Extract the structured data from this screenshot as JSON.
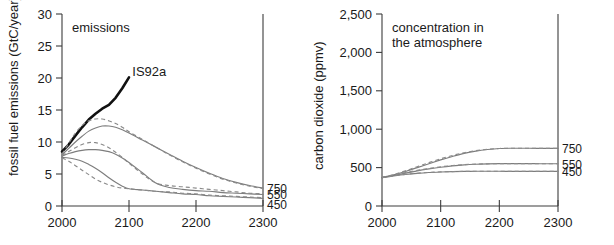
{
  "figure": {
    "panel_count": 2
  },
  "chart_data": [
    {
      "type": "line",
      "panel_id": "emissions",
      "title": "emissions",
      "xlabel": "",
      "ylabel": "fossil fuel emissions (GtC/year)",
      "xlim": [
        2000,
        2300
      ],
      "ylim": [
        0,
        30
      ],
      "xticks": [
        2000,
        2100,
        2200,
        2300
      ],
      "xtick_labels": [
        "2000",
        "2100",
        "2200",
        "2300"
      ],
      "yticks": [
        0,
        5,
        10,
        15,
        20,
        25,
        30
      ],
      "ytick_labels": [
        "0",
        "5",
        "10",
        "15",
        "20",
        "25",
        "30"
      ],
      "grid": false,
      "legend_position": "right-edge-inline",
      "right_edge_labels": [
        "750",
        "550",
        "450"
      ],
      "annotations": [
        {
          "text": "IS92a",
          "x": 2105,
          "y": 20.0
        }
      ],
      "series": [
        {
          "name": "IS92a",
          "style": "solid-bold",
          "x": [
            2000,
            2010,
            2020,
            2030,
            2040,
            2050,
            2060,
            2070,
            2080,
            2090,
            2100
          ],
          "values": [
            8.5,
            9.6,
            11.0,
            12.3,
            13.5,
            14.4,
            15.2,
            15.8,
            16.9,
            18.4,
            20.1
          ]
        },
        {
          "name": "750 (WRE750 solid)",
          "style": "solid",
          "x": [
            2000,
            2010,
            2020,
            2030,
            2040,
            2050,
            2060,
            2070,
            2080,
            2090,
            2100,
            2120,
            2140,
            2160,
            2180,
            2200,
            2220,
            2240,
            2260,
            2280,
            2300
          ],
          "values": [
            8.0,
            9.0,
            10.0,
            10.9,
            11.7,
            12.2,
            12.5,
            12.5,
            12.3,
            11.9,
            11.4,
            10.3,
            9.2,
            8.1,
            7.0,
            6.0,
            5.1,
            4.3,
            3.7,
            3.2,
            2.8
          ]
        },
        {
          "name": "750 (S750 dashed)",
          "style": "dashed",
          "x": [
            2000,
            2010,
            2020,
            2030,
            2040,
            2050,
            2060,
            2070,
            2080,
            2090,
            2100,
            2120,
            2140,
            2160,
            2180,
            2200,
            2220,
            2240,
            2260,
            2280,
            2300
          ],
          "values": [
            8.1,
            9.8,
            11.4,
            12.6,
            13.3,
            13.6,
            13.6,
            13.3,
            12.9,
            12.3,
            11.6,
            10.4,
            9.2,
            8.0,
            6.9,
            5.9,
            5.0,
            4.2,
            3.6,
            3.1,
            2.7
          ]
        },
        {
          "name": "550 (WRE550 solid)",
          "style": "solid",
          "x": [
            2000,
            2010,
            2020,
            2030,
            2040,
            2050,
            2060,
            2070,
            2080,
            2090,
            2100,
            2120,
            2140,
            2160,
            2180,
            2200,
            2220,
            2240,
            2260,
            2280,
            2300
          ],
          "values": [
            7.8,
            8.2,
            8.5,
            8.7,
            8.8,
            8.8,
            8.7,
            8.5,
            8.1,
            7.5,
            6.8,
            5.2,
            3.6,
            2.9,
            2.6,
            2.4,
            2.3,
            2.1,
            2.0,
            1.9,
            1.8
          ]
        },
        {
          "name": "550 (S550 dashed)",
          "style": "dashed",
          "x": [
            2000,
            2010,
            2020,
            2030,
            2040,
            2050,
            2060,
            2070,
            2080,
            2090,
            2100,
            2120,
            2140,
            2160,
            2180,
            2200,
            2220,
            2240,
            2260,
            2280,
            2300
          ],
          "values": [
            7.9,
            8.5,
            9.1,
            9.6,
            9.9,
            9.9,
            9.6,
            9.1,
            8.4,
            7.6,
            6.7,
            5.0,
            3.6,
            3.2,
            3.0,
            2.8,
            2.6,
            2.4,
            2.2,
            2.0,
            1.9
          ]
        },
        {
          "name": "450 (WRE450 solid)",
          "style": "solid",
          "x": [
            2000,
            2010,
            2020,
            2030,
            2040,
            2050,
            2060,
            2070,
            2080,
            2090,
            2100,
            2120,
            2140,
            2160,
            2180,
            2200,
            2220,
            2240,
            2260,
            2280,
            2300
          ],
          "values": [
            7.6,
            7.5,
            7.3,
            7.0,
            6.5,
            5.9,
            5.2,
            4.4,
            3.7,
            3.1,
            2.7,
            2.5,
            2.3,
            2.1,
            1.9,
            1.8,
            1.6,
            1.5,
            1.4,
            1.3,
            1.2
          ]
        },
        {
          "name": "450 (S450 dashed)",
          "style": "dashed",
          "x": [
            2000,
            2010,
            2020,
            2030,
            2040,
            2050,
            2060,
            2070,
            2080,
            2090,
            2100,
            2120,
            2140,
            2160,
            2180,
            2200,
            2220,
            2240,
            2260,
            2280,
            2300
          ],
          "values": [
            7.5,
            7.0,
            6.3,
            5.6,
            4.9,
            4.2,
            3.7,
            3.3,
            3.0,
            2.8,
            2.7,
            2.5,
            2.3,
            2.2,
            2.0,
            1.9,
            1.7,
            1.6,
            1.5,
            1.4,
            1.3
          ]
        }
      ]
    },
    {
      "type": "line",
      "panel_id": "concentration",
      "title": "concentration in the atmosphere",
      "title_line_1": "concentration in",
      "title_line_2": "the atmosphere",
      "xlabel": "",
      "ylabel": "carbon dioxide (ppmv)",
      "xlim": [
        2000,
        2300
      ],
      "ylim": [
        0,
        2500
      ],
      "xticks": [
        2000,
        2100,
        2200,
        2300
      ],
      "xtick_labels": [
        "2000",
        "2100",
        "2200",
        "2300"
      ],
      "yticks": [
        0,
        500,
        1000,
        1500,
        2000,
        2500
      ],
      "ytick_labels": [
        "0",
        "500",
        "1,000",
        "1,500",
        "2,000",
        "2,500"
      ],
      "grid": false,
      "legend_position": "right-edge-inline",
      "right_edge_labels": [
        "750",
        "550",
        "450"
      ],
      "series": [
        {
          "name": "750 (WRE750 solid)",
          "style": "solid",
          "x": [
            2000,
            2020,
            2040,
            2060,
            2080,
            2100,
            2120,
            2140,
            2160,
            2180,
            2200,
            2220,
            2240,
            2260,
            2280,
            2300
          ],
          "values": [
            370,
            405,
            450,
            500,
            550,
            600,
            645,
            685,
            715,
            735,
            748,
            752,
            752,
            751,
            750,
            750
          ]
        },
        {
          "name": "750 (S750 dashed)",
          "style": "dashed",
          "x": [
            2000,
            2020,
            2040,
            2060,
            2080,
            2100,
            2120,
            2140,
            2160,
            2180,
            2200,
            2220,
            2240,
            2260,
            2280,
            2300
          ],
          "values": [
            370,
            410,
            458,
            512,
            565,
            615,
            658,
            694,
            720,
            738,
            749,
            752,
            752,
            751,
            750,
            750
          ]
        },
        {
          "name": "550 (WRE550 solid)",
          "style": "solid",
          "x": [
            2000,
            2020,
            2040,
            2060,
            2080,
            2100,
            2120,
            2140,
            2160,
            2180,
            2200,
            2220,
            2240,
            2260,
            2280,
            2300
          ],
          "values": [
            370,
            398,
            428,
            458,
            483,
            505,
            522,
            535,
            543,
            548,
            551,
            552,
            552,
            551,
            550,
            550
          ]
        },
        {
          "name": "550 (S550 dashed)",
          "style": "dashed",
          "x": [
            2000,
            2020,
            2040,
            2060,
            2080,
            2100,
            2120,
            2140,
            2160,
            2180,
            2200,
            2220,
            2240,
            2260,
            2280,
            2300
          ],
          "values": [
            370,
            402,
            434,
            464,
            489,
            510,
            527,
            538,
            545,
            549,
            551,
            552,
            552,
            551,
            550,
            550
          ]
        },
        {
          "name": "450 (WRE450 solid)",
          "style": "solid",
          "x": [
            2000,
            2020,
            2040,
            2060,
            2080,
            2100,
            2120,
            2140,
            2160,
            2180,
            2200,
            2220,
            2240,
            2260,
            2280,
            2300
          ],
          "values": [
            370,
            391,
            410,
            425,
            436,
            443,
            448,
            451,
            452,
            452,
            452,
            451,
            451,
            450,
            450,
            450
          ]
        },
        {
          "name": "450 (S450 dashed)",
          "style": "dashed",
          "x": [
            2000,
            2020,
            2040,
            2060,
            2080,
            2100,
            2120,
            2140,
            2160,
            2180,
            2200,
            2220,
            2240,
            2260,
            2280,
            2300
          ],
          "values": [
            370,
            393,
            412,
            427,
            437,
            444,
            448,
            451,
            452,
            452,
            452,
            451,
            451,
            450,
            450,
            450
          ]
        }
      ]
    }
  ]
}
